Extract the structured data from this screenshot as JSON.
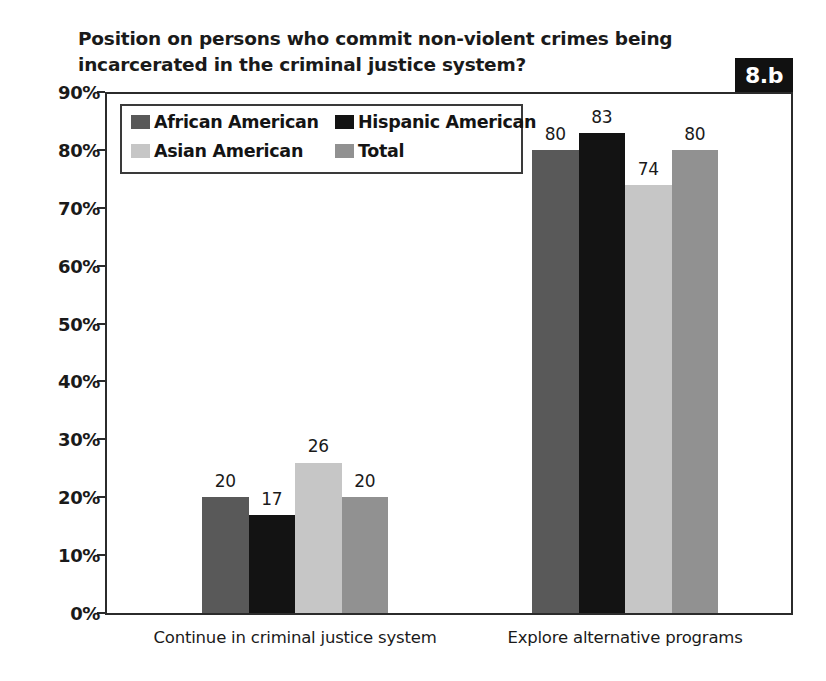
{
  "chart_data": {
    "type": "bar",
    "title": "Position on persons who commit non-violent crimes being\nincarcerated in the criminal justice system?",
    "figure_label": "8.b",
    "xlabel": "",
    "ylabel": "",
    "ylim": [
      0,
      90
    ],
    "grid": false,
    "legend_position": "upper-left-inside",
    "categories": [
      "Continue in criminal justice system",
      "Explore alternative programs"
    ],
    "ytick_labels": [
      "90%",
      "80%",
      "70%",
      "60%",
      "50%",
      "40%",
      "30%",
      "20%",
      "10%",
      "0%"
    ],
    "ytick_values": [
      90,
      80,
      70,
      60,
      50,
      40,
      30,
      20,
      10,
      0
    ],
    "series": [
      {
        "name": "African American",
        "color": "#595959",
        "values": [
          20,
          80
        ]
      },
      {
        "name": "Hispanic American",
        "color": "#131313",
        "values": [
          17,
          83
        ]
      },
      {
        "name": "Asian American",
        "color": "#c6c6c6",
        "values": [
          26,
          74
        ]
      },
      {
        "name": "Total",
        "color": "#919191",
        "values": [
          20,
          80
        ]
      }
    ],
    "value_labels": [
      [
        "20",
        "17",
        "26",
        "20"
      ],
      [
        "80",
        "83",
        "74",
        "80"
      ]
    ]
  }
}
